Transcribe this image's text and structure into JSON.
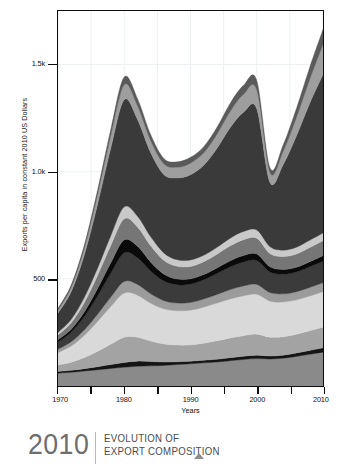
{
  "axes": {
    "ylabel": "Exports per capita in constant 2010 US Dollars",
    "xlabel": "Years",
    "yticks": [
      {
        "label": "1.5k",
        "value": 1500
      },
      {
        "label": "1.0k",
        "value": 1000
      },
      {
        "label": "500",
        "value": 500
      }
    ],
    "xticks": [
      {
        "label": "1970",
        "value": 1970,
        "major": true
      },
      {
        "label": "",
        "value": 1975,
        "major": false
      },
      {
        "label": "1980",
        "value": 1980,
        "major": true
      },
      {
        "label": "",
        "value": 1985,
        "major": false
      },
      {
        "label": "1990",
        "value": 1990,
        "major": true
      },
      {
        "label": "",
        "value": 1995,
        "major": false
      },
      {
        "label": "2000",
        "value": 2000,
        "major": true
      },
      {
        "label": "",
        "value": 2005,
        "major": false
      },
      {
        "label": "2010",
        "value": 2010,
        "major": true
      }
    ]
  },
  "footer": {
    "year": "2010",
    "title_line1": "EVOLUTION OF",
    "title_line2": "EXPORT COMPOSITION",
    "marker_icon": "triangle-up-icon"
  },
  "colors": {
    "frame": "#0d0d0d",
    "gridline": "#eceff1",
    "plot_background": "#ffffff",
    "footer_year": "#6e6e6e",
    "footer_title": "#4c4c4c",
    "footer_rule": "#b9b9b9",
    "footer_marker": "#8e8e8e"
  },
  "chart_data": {
    "type": "area",
    "stacked": true,
    "title": "EVOLUTION OF EXPORT COMPOSITION",
    "xlabel": "Years",
    "ylabel": "Exports per capita in constant 2010 US Dollars",
    "xlim": [
      1970,
      2010
    ],
    "ylim": [
      0,
      1750
    ],
    "grid": "vertical",
    "legend": "none",
    "x": [
      1970,
      1972,
      1974,
      1976,
      1978,
      1980,
      1982,
      1984,
      1986,
      1988,
      1990,
      1992,
      1994,
      1996,
      1998,
      2000,
      2002,
      2004,
      2006,
      2008,
      2010
    ],
    "series": [
      {
        "name": "band-01",
        "color": "#8a8a8a",
        "values": [
          60,
          64,
          70,
          76,
          82,
          88,
          92,
          94,
          96,
          100,
          104,
          108,
          112,
          118,
          124,
          128,
          126,
          130,
          138,
          148,
          158
        ]
      },
      {
        "name": "band-02",
        "color": "#141414",
        "values": [
          8,
          9,
          11,
          14,
          18,
          22,
          24,
          20,
          16,
          13,
          12,
          12,
          13,
          14,
          15,
          16,
          14,
          14,
          16,
          18,
          20
        ]
      },
      {
        "name": "band-03",
        "color": "#a3a3a3",
        "values": [
          30,
          38,
          52,
          72,
          96,
          118,
          112,
          96,
          84,
          78,
          76,
          80,
          86,
          92,
          96,
          98,
          88,
          86,
          88,
          92,
          96
        ]
      },
      {
        "name": "band-04",
        "color": "#d9d9d9",
        "values": [
          58,
          76,
          104,
          140,
          176,
          206,
          196,
          176,
          164,
          160,
          162,
          168,
          176,
          182,
          186,
          186,
          168,
          162,
          160,
          162,
          166
        ]
      },
      {
        "name": "band-05",
        "color": "#9b9b9b",
        "values": [
          16,
          20,
          26,
          34,
          44,
          54,
          50,
          44,
          38,
          36,
          36,
          38,
          40,
          44,
          46,
          46,
          40,
          38,
          38,
          40,
          42
        ]
      },
      {
        "name": "band-06",
        "color": "#3b3b3b",
        "values": [
          34,
          44,
          62,
          86,
          112,
          134,
          124,
          106,
          92,
          86,
          86,
          90,
          98,
          106,
          112,
          112,
          96,
          92,
          92,
          96,
          100
        ]
      },
      {
        "name": "band-07",
        "color": "#0a0a0a",
        "values": [
          10,
          14,
          22,
          34,
          48,
          60,
          54,
          42,
          32,
          26,
          24,
          24,
          26,
          28,
          30,
          30,
          24,
          22,
          22,
          24,
          26
        ]
      },
      {
        "name": "band-08",
        "color": "#767676",
        "values": [
          22,
          30,
          44,
          62,
          82,
          98,
          90,
          76,
          64,
          60,
          58,
          60,
          64,
          70,
          74,
          74,
          62,
          60,
          62,
          66,
          70
        ]
      },
      {
        "name": "band-09",
        "color": "#c9c9c9",
        "values": [
          12,
          16,
          24,
          34,
          46,
          56,
          50,
          42,
          34,
          30,
          30,
          30,
          32,
          36,
          38,
          38,
          32,
          30,
          32,
          34,
          36
        ]
      },
      {
        "name": "band-10",
        "color": "#3a3a3a",
        "values": [
          90,
          130,
          200,
          300,
          410,
          500,
          452,
          392,
          366,
          382,
          398,
          420,
          462,
          516,
          556,
          566,
          300,
          400,
          520,
          640,
          740
        ]
      },
      {
        "name": "band-11",
        "color": "#9e9e9e",
        "values": [
          14,
          20,
          30,
          44,
          58,
          70,
          64,
          56,
          50,
          50,
          54,
          58,
          66,
          76,
          84,
          88,
          46,
          62,
          86,
          112,
          140
        ]
      },
      {
        "name": "band-12",
        "color": "#5a5a5a",
        "values": [
          8,
          11,
          16,
          22,
          30,
          36,
          33,
          28,
          25,
          25,
          27,
          29,
          33,
          38,
          42,
          44,
          22,
          30,
          42,
          56,
          70
        ]
      }
    ]
  }
}
